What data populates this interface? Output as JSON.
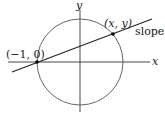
{
  "diagram": {
    "axes": {
      "x_label": "x",
      "y_label": "y"
    },
    "circle": {
      "center": [
        80,
        62
      ],
      "radius": 43,
      "stroke": "#555555"
    },
    "points": [
      {
        "label": "(−1, 0)",
        "px": [
          37,
          62
        ]
      },
      {
        "label": "(x, y)",
        "px": [
          113,
          34
        ]
      }
    ],
    "line": {
      "label_prefix": "slope ",
      "label_var": "t"
    }
  }
}
